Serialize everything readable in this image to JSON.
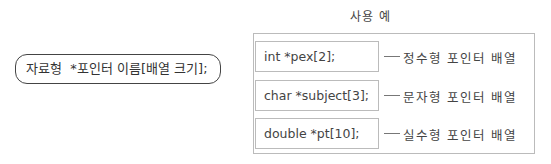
{
  "syntax": {
    "text": "자료형  *포인터 이름[배열 크기];"
  },
  "examples": {
    "title": "사용 예",
    "rows": [
      {
        "code": "int *pex[2];",
        "description": "정수형 포인터 배열"
      },
      {
        "code": "char *subject[3];",
        "description": "문자형 포인터 배열"
      },
      {
        "code": "double *pt[10];",
        "description": "실수형 포인터 배열"
      }
    ]
  }
}
